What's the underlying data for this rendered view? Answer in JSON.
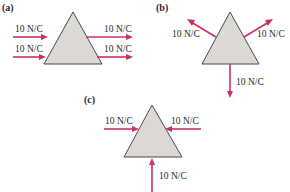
{
  "figure": {
    "panels": [
      {
        "id": "a",
        "label": "(a)",
        "arrows": [
          {
            "label": "10 N/C",
            "direction": "right",
            "position": "left-upper"
          },
          {
            "label": "10 N/C",
            "direction": "right",
            "position": "left-lower"
          },
          {
            "label": "10 N/C",
            "direction": "right",
            "position": "right-upper"
          },
          {
            "label": "10 N/C",
            "direction": "right",
            "position": "right-lower"
          }
        ]
      },
      {
        "id": "b",
        "label": "(b)",
        "arrows": [
          {
            "label": "10 N/C",
            "direction": "up-left",
            "position": "left-face"
          },
          {
            "label": "10 N/C",
            "direction": "up-right",
            "position": "right-face"
          },
          {
            "label": "10 N/C",
            "direction": "down",
            "position": "base"
          }
        ]
      },
      {
        "id": "c",
        "label": "(c)",
        "arrows": [
          {
            "label": "10 N/C",
            "direction": "right",
            "position": "left"
          },
          {
            "label": "10 N/C",
            "direction": "left",
            "position": "right"
          },
          {
            "label": "10 N/C",
            "direction": "up",
            "position": "bottom"
          }
        ]
      }
    ],
    "colors": {
      "arrow": "#c8306a",
      "triangle_fill": "#dcd8d4",
      "triangle_stroke": "#4a4a4a",
      "text": "#2a2a2a"
    }
  }
}
